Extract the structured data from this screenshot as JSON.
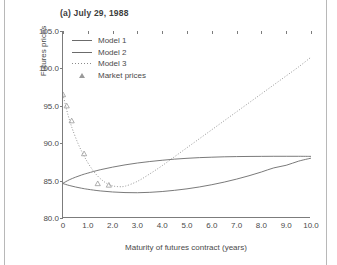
{
  "figure": {
    "title": "(a) July 29, 1988"
  },
  "legend": {
    "items": [
      {
        "label": "Model 1",
        "key": "solid-line",
        "color": "#6b6b6b"
      },
      {
        "label": "Model 2",
        "key": "solid-line",
        "color": "#6b6b6b"
      },
      {
        "label": "Model 3",
        "key": "dotted-line",
        "color": "#8a8a8a"
      },
      {
        "label": "Market prices",
        "key": "triangle-marker",
        "color": "#9a9a9a"
      }
    ]
  },
  "chart_data": {
    "type": "line",
    "title": "(a) July 29, 1988",
    "xlabel": "Maturity of futures contract (years)",
    "ylabel": "Futures prices",
    "xlim": [
      0,
      10
    ],
    "ylim": [
      80.0,
      105.0
    ],
    "xticks": [
      0,
      1,
      2,
      3,
      4,
      5,
      6,
      7,
      8,
      9,
      10
    ],
    "xticklabels": [
      "0",
      "1.0",
      "2.0",
      "3.0",
      "4.0",
      "5.0",
      "6.0",
      "7.0",
      "8.0",
      "9.0",
      "10.0"
    ],
    "yticks": [
      80.0,
      85.0,
      90.0,
      95.0,
      100.0,
      105.0
    ],
    "yticklabels": [
      "80.0",
      "85.0",
      "90.0",
      "95.0",
      "100.0",
      "105.0"
    ],
    "grid": false,
    "legend_position": "upper-left-inside",
    "series": [
      {
        "name": "Model 1",
        "style": "solid",
        "color": "#6b6b6b",
        "x": [
          0,
          0.25,
          0.5,
          0.75,
          1.0,
          1.5,
          2.0,
          2.5,
          3.0,
          3.5,
          4.0,
          4.5,
          5.0,
          5.5,
          6.0,
          6.5,
          7.0,
          7.5,
          8.0,
          8.5,
          9.0,
          9.5,
          10.0
        ],
        "y": [
          84.65,
          85.1,
          85.45,
          85.75,
          86.0,
          86.45,
          86.8,
          87.1,
          87.35,
          87.55,
          87.72,
          87.87,
          87.98,
          88.07,
          88.13,
          88.18,
          88.21,
          88.23,
          88.24,
          88.25,
          88.25,
          88.25,
          88.24
        ]
      },
      {
        "name": "Model 2",
        "style": "solid",
        "color": "#6b6b6b",
        "x": [
          0,
          0.25,
          0.5,
          0.75,
          1.0,
          1.5,
          2.0,
          2.5,
          3.0,
          3.5,
          4.0,
          4.5,
          5.0,
          5.5,
          6.0,
          6.5,
          7.0,
          7.5,
          8.0,
          8.5,
          9.0,
          9.5,
          10.0
        ],
        "y": [
          84.6,
          84.35,
          84.15,
          83.98,
          83.84,
          83.62,
          83.48,
          83.4,
          83.38,
          83.43,
          83.54,
          83.7,
          83.9,
          84.15,
          84.45,
          84.8,
          85.2,
          85.65,
          86.15,
          86.7,
          87.05,
          87.6,
          88.0
        ]
      },
      {
        "name": "Model 3",
        "style": "dotted",
        "color": "#8a8a8a",
        "x": [
          0,
          0.1,
          0.2,
          0.3,
          0.4,
          0.6,
          0.8,
          1.0,
          1.2,
          1.4,
          1.6,
          1.8,
          2.0,
          2.2,
          2.5,
          3.0,
          3.5,
          4.0,
          4.5,
          5.0,
          5.5,
          6.0,
          6.5,
          7.0,
          7.5,
          8.0,
          8.5,
          9.0,
          9.5,
          10.0
        ],
        "y": [
          96.5,
          95.1,
          93.8,
          92.7,
          91.7,
          90.0,
          88.6,
          87.4,
          86.4,
          85.6,
          85.0,
          84.55,
          84.3,
          84.2,
          84.25,
          84.9,
          85.9,
          87.0,
          88.2,
          89.4,
          90.6,
          91.8,
          93.0,
          94.2,
          95.4,
          96.6,
          97.8,
          99.0,
          100.2,
          101.5
        ]
      },
      {
        "name": "Market prices",
        "style": "markers",
        "marker": "triangle",
        "color": "#9a9a9a",
        "x": [
          0.0,
          0.15,
          0.35,
          0.85,
          1.4,
          1.85
        ],
        "y": [
          96.5,
          95.0,
          93.0,
          88.6,
          84.6,
          84.4
        ]
      }
    ]
  }
}
